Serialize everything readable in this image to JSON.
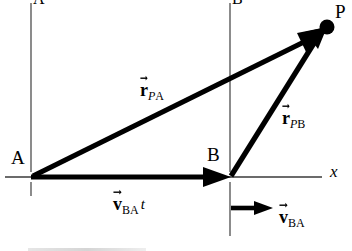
{
  "figure": {
    "type": "vector-diagram",
    "background_color": "#ffffff",
    "stroke_color": "#000000",
    "axis_color": "#555555"
  },
  "points": {
    "A": {
      "label": "A",
      "x": 31,
      "y": 177
    },
    "B": {
      "label": "B",
      "x": 230,
      "y": 177
    },
    "P": {
      "label": "P",
      "x": 327,
      "y": 27
    }
  },
  "axes": {
    "x_label": "x",
    "frame_A_top_label": "A",
    "frame_B_top_label": "B"
  },
  "vectors": [
    {
      "name": "r_PA",
      "symbol": "r",
      "subscript_italic": "P",
      "subscript_roman": "A",
      "from": "A",
      "to": "P",
      "label_x": 140,
      "label_y": 75
    },
    {
      "name": "r_PB",
      "symbol": "r",
      "subscript_italic": "P",
      "subscript_roman": "B",
      "from": "B",
      "to": "P",
      "label_x": 282,
      "label_y": 103
    },
    {
      "name": "v_BA_t",
      "symbol": "v",
      "subscript_italic": "",
      "subscript_roman": "BA",
      "postfix": "t",
      "from": "A",
      "to": "B",
      "label_x": 113,
      "label_y": 189
    },
    {
      "name": "v_BA",
      "symbol": "v",
      "subscript_italic": "",
      "subscript_roman": "BA",
      "postfix": "",
      "label_x": 279,
      "label_y": 202
    }
  ]
}
